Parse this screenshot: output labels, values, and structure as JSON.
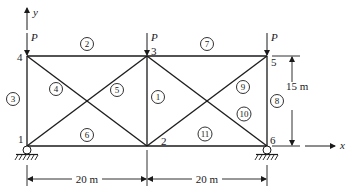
{
  "diagram": {
    "type": "plane truss",
    "axes": {
      "x_label": "x",
      "y_label": "y"
    },
    "load_label": "P",
    "nodes": [
      {
        "id": "1",
        "label": "1",
        "x": 27,
        "y": 146,
        "support": "pin"
      },
      {
        "id": "2",
        "label": "2",
        "x": 147,
        "y": 146
      },
      {
        "id": "3",
        "label": "3",
        "x": 147,
        "y": 56,
        "load": "P"
      },
      {
        "id": "4",
        "label": "4",
        "x": 27,
        "y": 56,
        "load": "P"
      },
      {
        "id": "5",
        "label": "5",
        "x": 267,
        "y": 56,
        "load": "P"
      },
      {
        "id": "6",
        "label": "6",
        "x": 267,
        "y": 146,
        "support": "pin"
      }
    ],
    "members": [
      {
        "id": "1",
        "label": "1",
        "from": "2",
        "to": "3"
      },
      {
        "id": "2",
        "label": "2",
        "from": "4",
        "to": "3"
      },
      {
        "id": "3",
        "label": "3",
        "from": "1",
        "to": "4"
      },
      {
        "id": "4",
        "label": "4",
        "from": "4",
        "to": "2"
      },
      {
        "id": "5",
        "label": "5",
        "from": "1",
        "to": "3"
      },
      {
        "id": "6",
        "label": "6",
        "from": "1",
        "to": "2"
      },
      {
        "id": "7",
        "label": "7",
        "from": "3",
        "to": "5"
      },
      {
        "id": "8",
        "label": "8",
        "from": "6",
        "to": "5"
      },
      {
        "id": "9",
        "label": "9",
        "from": "2",
        "to": "5"
      },
      {
        "id": "10",
        "label": "10",
        "from": "3",
        "to": "6"
      },
      {
        "id": "11",
        "label": "11",
        "from": "2",
        "to": "6"
      }
    ],
    "dimensions": {
      "span_left": "20 m",
      "span_right": "20 m",
      "height": "15 m"
    }
  }
}
